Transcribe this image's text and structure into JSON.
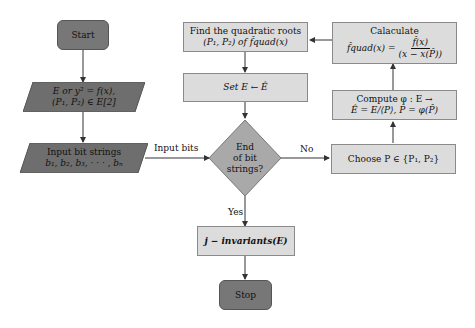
{
  "nodes": {
    "start": {
      "label": "Start"
    },
    "input_curve": {
      "line1": "E or y² = f(x),",
      "line2": "(P₁, P₂) ∈ E[2]"
    },
    "input_bits": {
      "line1": "Input bit strings",
      "line2": "b₁, b₂, b₃, · · · , bₙ"
    },
    "find_roots": {
      "line1": "Find the quadratic roots",
      "line2": "(P₁, P₂) of f̂quad(x)"
    },
    "set_e": {
      "label": "Set E ← Ê"
    },
    "decision": {
      "line1": "End",
      "line2": "of bit",
      "line3": "strings?"
    },
    "calculate": {
      "line1": "Calaculate",
      "line2_lhs": "f̂quad(x) =",
      "numerator": "f̂(x)",
      "denominator": "(x − x(P̂))"
    },
    "compute_phi": {
      "line1": "Compute φ : E →",
      "line2": "Ê = E/⟨P⟩, P̂ = φ(P̂)"
    },
    "choose_p": {
      "label": "Choose P ∈ {P₁, P₂}"
    },
    "j_invariants": {
      "label": "j − invariants(E)"
    },
    "stop": {
      "label": "Stop"
    }
  },
  "edges": {
    "input_bits_label": "Input bits",
    "no_label": "No",
    "yes_label": "Yes"
  },
  "colors": {
    "terminal_fill": "#777777",
    "io_fill": "#6e6e6e",
    "process_fill": "#dcdcdc",
    "decision_fill": "#a9a9a9",
    "line": "#333333"
  }
}
